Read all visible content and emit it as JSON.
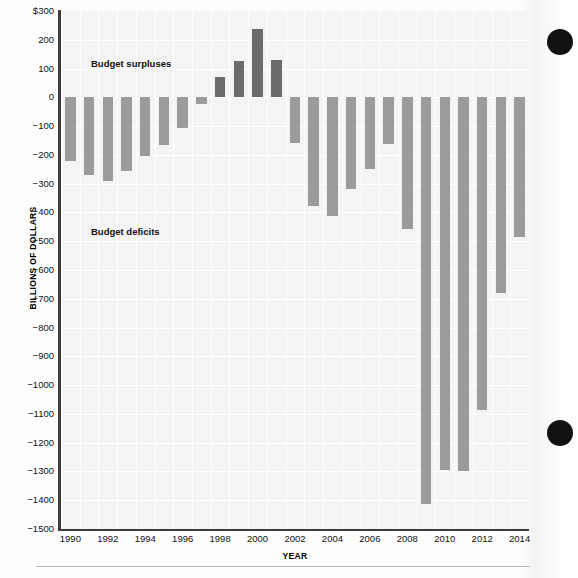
{
  "chart_data": {
    "type": "bar",
    "title": "",
    "xlabel": "YEAR",
    "ylabel": "BILLIONS OF DOLLARS",
    "ylim": [
      -1500,
      300
    ],
    "xlim": [
      1989.5,
      2014.5
    ],
    "grid": true,
    "legend_position": "none",
    "ytick_labels": [
      "$300",
      "200",
      "100",
      "0",
      "-100",
      "-200",
      "-300",
      "-400",
      "-500",
      "-600",
      "-700",
      "-800",
      "-900",
      "-1000",
      "-1100",
      "-1200",
      "-1300",
      "-1400",
      "-1500"
    ],
    "yticks": [
      300,
      200,
      100,
      0,
      -100,
      -200,
      -300,
      -400,
      -500,
      -600,
      -700,
      -800,
      -900,
      -1000,
      -1100,
      -1200,
      -1300,
      -1400,
      -1500
    ],
    "xtick_labels": [
      "1990",
      "1992",
      "1994",
      "1996",
      "1998",
      "2000",
      "2002",
      "2004",
      "2006",
      "2008",
      "2010",
      "2012",
      "2014"
    ],
    "xticks": [
      1990,
      1992,
      1994,
      1996,
      1998,
      2000,
      2002,
      2004,
      2006,
      2008,
      2010,
      2012,
      2014
    ],
    "categories": [
      1990,
      1991,
      1992,
      1993,
      1994,
      1995,
      1996,
      1997,
      1998,
      1999,
      2000,
      2001,
      2002,
      2003,
      2004,
      2005,
      2006,
      2007,
      2008,
      2009,
      2010,
      2011,
      2012,
      2013,
      2014
    ],
    "values": [
      -221,
      -269,
      -290,
      -255,
      -203,
      -164,
      -107,
      -22,
      69,
      126,
      236,
      128,
      -158,
      -378,
      -413,
      -318,
      -248,
      -161,
      -459,
      -1413,
      -1294,
      -1300,
      -1087,
      -680,
      -485
    ],
    "annotations": [
      {
        "text": "Budget surpluses",
        "value": 180
      },
      {
        "text": "Budget deficits",
        "value": -430
      }
    ],
    "colors": {
      "deficit_bar": "#9b9b9b",
      "surplus_bar": "#6b6b6b",
      "plot_background": "#f4f4f4",
      "gridline": "#ffffff",
      "axis": "#3b3b3b",
      "text": "#111111",
      "binder_hole": "#111111"
    }
  },
  "figure": {
    "ylabel": "BILLIONS OF DOLLARS",
    "xlabel": "YEAR",
    "note_surpluses": "Budget surpluses",
    "note_deficits": "Budget deficits"
  }
}
